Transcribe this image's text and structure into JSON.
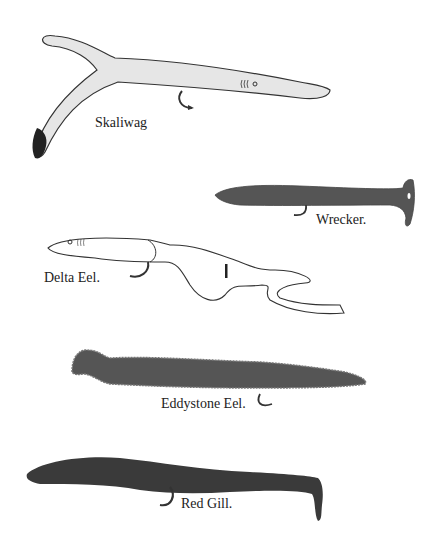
{
  "figure": {
    "colors": {
      "background": "#ffffff",
      "light_lure": "#e6e6e6",
      "dark_lure": "#555555",
      "outline": "#333333",
      "hook": "#333333"
    },
    "lures": [
      {
        "name": "Skaliwag",
        "body": "light",
        "feature": "forked tail with black tip"
      },
      {
        "name": "Wrecker.",
        "body": "dark",
        "feature": "paddle tail"
      },
      {
        "name": "Delta Eel.",
        "body": "light",
        "feature": "split ribbon tail"
      },
      {
        "name": "Eddystone Eel.",
        "body": "dark",
        "feature": "beaded fringe edge"
      },
      {
        "name": "Red Gill.",
        "body": "dark",
        "feature": "hooked paddle tail"
      }
    ]
  }
}
